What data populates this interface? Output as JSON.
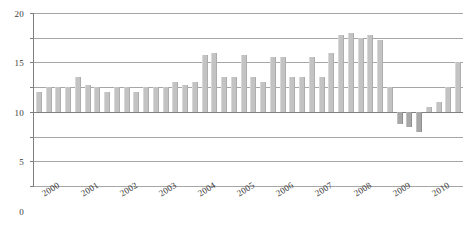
{
  "chart_data": {
    "type": "bar",
    "title": "",
    "subtitle": "",
    "xlabel": "",
    "ylabel": "",
    "grid": true,
    "legend": false,
    "legend_position": "none",
    "bar_color": "#c3c3c3",
    "axis_color": "#7f7f7f",
    "gridline_color": "#a6a6a6",
    "ylim": [
      -15,
      20
    ],
    "yticks": [
      20,
      15,
      10,
      5,
      0,
      -5,
      -10,
      -15
    ],
    "ytick_labels": [
      "20",
      "15",
      "10",
      "5",
      "0",
      "-5",
      "-10",
      "-15"
    ],
    "xtick_labels": [
      "2000",
      "2001",
      "2002",
      "2003",
      "2004",
      "2005",
      "2006",
      "2007",
      "2008",
      "2009",
      "2010"
    ],
    "x_label_rotation_deg": -32,
    "categories": [
      "2000 Q1",
      "2000 Q2",
      "2000 Q3",
      "2000 Q4",
      "2001 Q1",
      "2001 Q2",
      "2001 Q3",
      "2001 Q4",
      "2002 Q1",
      "2002 Q2",
      "2002 Q3",
      "2002 Q4",
      "2003 Q1",
      "2003 Q2",
      "2003 Q3",
      "2003 Q4",
      "2004 Q1",
      "2004 Q2",
      "2004 Q3",
      "2004 Q4",
      "2005 Q1",
      "2005 Q2",
      "2005 Q3",
      "2005 Q4",
      "2006 Q1",
      "2006 Q2",
      "2006 Q3",
      "2006 Q4",
      "2007 Q1",
      "2007 Q2",
      "2007 Q3",
      "2007 Q4",
      "2008 Q1",
      "2008 Q2",
      "2008 Q3",
      "2008 Q4",
      "2009 Q1",
      "2009 Q2",
      "2009 Q3",
      "2009 Q4",
      "2010 Q1",
      "2010 Q2",
      "2010 Q3",
      "2010 Q4"
    ],
    "values": [
      4.0,
      5.0,
      5.0,
      5.0,
      7.0,
      5.5,
      5.0,
      4.0,
      5.0,
      5.0,
      4.0,
      5.0,
      5.0,
      5.0,
      6.0,
      5.5,
      6.0,
      11.5,
      12.0,
      7.0,
      7.0,
      11.5,
      7.0,
      6.0,
      11.0,
      11.0,
      7.0,
      7.0,
      11.0,
      7.0,
      12.0,
      15.5,
      16.0,
      15.0,
      15.5,
      14.5,
      5.0,
      -2.5,
      -3.0,
      -4.0,
      1.0,
      2.0,
      5.0,
      10.0
    ]
  }
}
